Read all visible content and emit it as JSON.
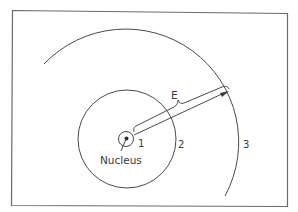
{
  "diagram": {
    "labels": {
      "nucleus": "Nucleus",
      "shell_1": "1",
      "shell_2": "2",
      "shell_3": "3",
      "energy": "E"
    },
    "colors": {
      "line": "#4a4a4a",
      "frame": "#6a6a6a",
      "text": "#3a3a3a",
      "background": "#ffffff"
    }
  }
}
